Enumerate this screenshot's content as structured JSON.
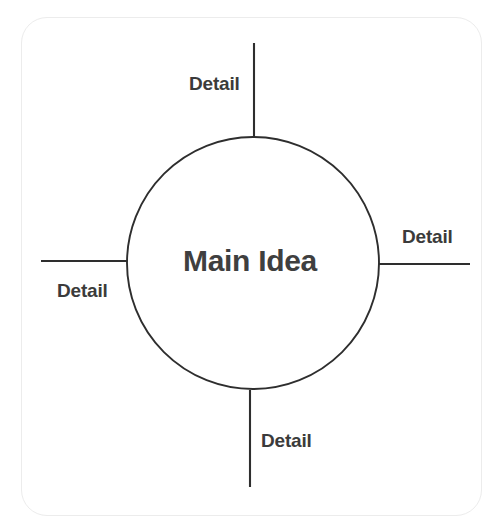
{
  "diagram": {
    "type": "concept-web",
    "center": {
      "label": "Main Idea",
      "shape": "circle",
      "cx": 253,
      "cy": 263,
      "r": 126,
      "stroke_color": "#2e2e2e",
      "fill_color": "#ffffff",
      "text_color": "#3f3f3f"
    },
    "spokes": [
      {
        "id": "top",
        "label": "Detail",
        "direction": "up",
        "line": {
          "x1": 254,
          "y1": 43,
          "x2": 254,
          "y2": 137
        },
        "label_position": "left-of-line"
      },
      {
        "id": "right",
        "label": "Detail",
        "direction": "right",
        "line": {
          "x1": 376,
          "y1": 264,
          "x2": 470,
          "y2": 264
        },
        "label_position": "above-line"
      },
      {
        "id": "bottom",
        "label": "Detail",
        "direction": "down",
        "line": {
          "x1": 250,
          "y1": 390,
          "x2": 250,
          "y2": 487
        },
        "label_position": "right-of-line"
      },
      {
        "id": "left",
        "label": "Detail",
        "direction": "left",
        "line": {
          "x1": 41,
          "y1": 261,
          "x2": 131,
          "y2": 261
        },
        "label_position": "below-line"
      }
    ],
    "card": {
      "background_color": "#ffffff",
      "border_color": "#ececec",
      "corner_radius": 26
    },
    "canvas": {
      "background_color": "#ffffff",
      "width": 500,
      "height": 527
    },
    "line_color": "#2e2e2e",
    "label_text_color": "#3b3b3b"
  }
}
